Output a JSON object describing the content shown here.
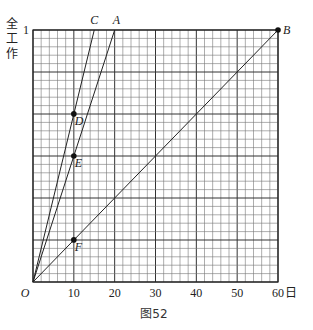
{
  "chart_data": {
    "type": "line",
    "title": "",
    "caption": "图52",
    "xlabel": "日",
    "ylabel": "全工作",
    "xlim": [
      0,
      60
    ],
    "ylim": [
      0,
      1
    ],
    "x_ticks": [
      "10",
      "20",
      "30",
      "40",
      "50",
      "60"
    ],
    "y_ticks": [
      "1"
    ],
    "origin_label": "O",
    "grid": true,
    "grid_x_step": 2,
    "grid_y_step": 0.0333,
    "series": [
      {
        "name": "OC",
        "label": "C",
        "points": [
          [
            0,
            0
          ],
          [
            15,
            1
          ]
        ]
      },
      {
        "name": "OA",
        "label": "A",
        "points": [
          [
            0,
            0
          ],
          [
            20,
            1
          ]
        ]
      },
      {
        "name": "OB",
        "label": "B",
        "points": [
          [
            0,
            0
          ],
          [
            60,
            1
          ]
        ]
      }
    ],
    "marked_points": [
      {
        "label": "B",
        "x": 60,
        "y": 1
      },
      {
        "label": "D",
        "x": 10,
        "y": 0.667
      },
      {
        "label": "E",
        "x": 10,
        "y": 0.5
      },
      {
        "label": "F",
        "x": 10,
        "y": 0.167
      }
    ]
  }
}
